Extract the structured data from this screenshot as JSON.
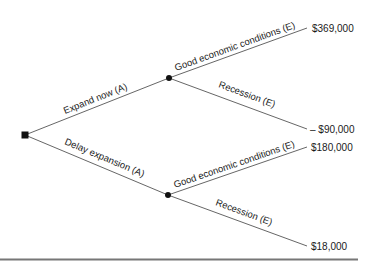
{
  "diagram": {
    "type": "decision-tree",
    "decision_node": {
      "shape": "square"
    },
    "branches": [
      {
        "label": "Expand now (A)",
        "outcomes": [
          {
            "label": "Good economic conditions (E)",
            "payoff": "$369,000"
          },
          {
            "label": "Recession (E)",
            "payoff": "– $90,000"
          }
        ]
      },
      {
        "label": "Delay expansion (A)",
        "outcomes": [
          {
            "label": "Good economic conditions (E)",
            "payoff": "$180,000"
          },
          {
            "label": "Recession (E)",
            "payoff": "$18,000"
          }
        ]
      }
    ],
    "colors": {
      "line": "#555555",
      "node": "#111111",
      "rule": "#777777",
      "text": "#1a1a1a"
    }
  }
}
